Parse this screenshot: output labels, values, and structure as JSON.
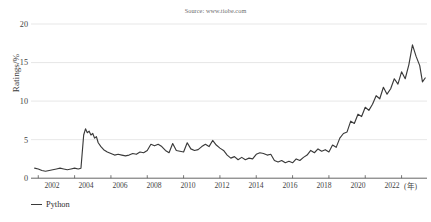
{
  "figure": {
    "source_note": "Source: www.tiobe.com",
    "title_cropped": "",
    "line_color": "#3a3a3a",
    "grid_color": "#dcdcdc",
    "axis_color": "#555555",
    "background": "#ffffff"
  },
  "legend": {
    "position": "bottom-left",
    "entries": [
      {
        "label": "Python",
        "color": "#3a3a3a",
        "marker": "line-swatch"
      }
    ]
  },
  "axes": {
    "y_ticks": [
      "0",
      "5",
      "10",
      "15",
      "20"
    ],
    "y_tick_values": [
      0,
      5,
      10,
      15,
      20
    ],
    "x_ticks": [
      "2002",
      "2004",
      "2006",
      "2008",
      "2010",
      "2012",
      "2014",
      "2016",
      "2018",
      "2020",
      "2022"
    ],
    "x_tick_values": [
      2002,
      2004,
      2006,
      2008,
      2010,
      2012,
      2014,
      2016,
      2018,
      2020,
      2022
    ],
    "x_unit": "(年)"
  },
  "chart_data": {
    "type": "line",
    "title": "",
    "subtitle": "Source: www.tiobe.com",
    "xlabel": "(年)",
    "ylabel": "Ratings/%",
    "xlim": [
      2001.6,
      2023.4
    ],
    "ylim": [
      0,
      20
    ],
    "grid": true,
    "grid_axis": "y",
    "legend_position": "bottom-left",
    "annotations": [],
    "series": [
      {
        "name": "Python",
        "color": "#3a3a3a",
        "x": [
          2001.8,
          2002.0,
          2002.2,
          2002.4,
          2002.6,
          2002.8,
          2003.0,
          2003.2,
          2003.4,
          2003.6,
          2003.8,
          2004.0,
          2004.2,
          2004.35,
          2004.5,
          2004.6,
          2004.7,
          2004.8,
          2004.9,
          2005.0,
          2005.1,
          2005.2,
          2005.3,
          2005.45,
          2005.6,
          2005.8,
          2006.0,
          2006.2,
          2006.4,
          2006.6,
          2006.8,
          2007.0,
          2007.2,
          2007.4,
          2007.6,
          2007.8,
          2008.0,
          2008.2,
          2008.4,
          2008.6,
          2008.8,
          2009.0,
          2009.2,
          2009.4,
          2009.6,
          2009.8,
          2010.0,
          2010.2,
          2010.4,
          2010.6,
          2010.8,
          2011.0,
          2011.2,
          2011.4,
          2011.6,
          2011.8,
          2012.0,
          2012.2,
          2012.4,
          2012.6,
          2012.8,
          2013.0,
          2013.2,
          2013.4,
          2013.6,
          2013.8,
          2014.0,
          2014.2,
          2014.4,
          2014.6,
          2014.8,
          2015.0,
          2015.2,
          2015.4,
          2015.6,
          2015.8,
          2016.0,
          2016.2,
          2016.4,
          2016.6,
          2016.8,
          2017.0,
          2017.2,
          2017.4,
          2017.6,
          2017.8,
          2018.0,
          2018.2,
          2018.4,
          2018.6,
          2018.8,
          2019.0,
          2019.2,
          2019.4,
          2019.6,
          2019.8,
          2020.0,
          2020.2,
          2020.4,
          2020.6,
          2020.8,
          2021.0,
          2021.2,
          2021.4,
          2021.6,
          2021.8,
          2022.0,
          2022.2,
          2022.4,
          2022.6,
          2022.8,
          2023.0,
          2023.15,
          2023.3
        ],
        "y": [
          1.3,
          1.2,
          1.0,
          0.9,
          1.0,
          1.1,
          1.2,
          1.3,
          1.2,
          1.1,
          1.2,
          1.3,
          1.2,
          1.3,
          5.6,
          6.4,
          5.9,
          6.1,
          5.6,
          5.8,
          5.2,
          5.4,
          4.6,
          4.1,
          3.7,
          3.4,
          3.2,
          3.0,
          3.1,
          3.0,
          2.9,
          3.0,
          3.2,
          3.1,
          3.4,
          3.3,
          3.6,
          4.4,
          4.2,
          4.4,
          4.1,
          3.6,
          3.3,
          4.5,
          3.6,
          3.5,
          3.4,
          4.6,
          3.8,
          3.6,
          3.7,
          4.1,
          4.4,
          4.1,
          4.9,
          4.3,
          3.9,
          3.6,
          3.0,
          2.6,
          2.8,
          2.4,
          2.7,
          2.4,
          2.6,
          2.5,
          3.1,
          3.3,
          3.2,
          3.0,
          3.1,
          2.3,
          2.1,
          2.3,
          2.0,
          2.2,
          2.0,
          2.5,
          2.3,
          2.7,
          3.0,
          3.6,
          3.3,
          3.8,
          3.5,
          3.7,
          3.4,
          4.3,
          4.0,
          5.2,
          5.8,
          6.0,
          7.4,
          7.1,
          8.3,
          8.0,
          9.2,
          8.8,
          9.6,
          10.7,
          10.3,
          11.8,
          10.9,
          11.6,
          12.9,
          12.2,
          13.8,
          12.9,
          14.7,
          17.3,
          15.8,
          14.6,
          12.5,
          13.0
        ]
      }
    ]
  }
}
